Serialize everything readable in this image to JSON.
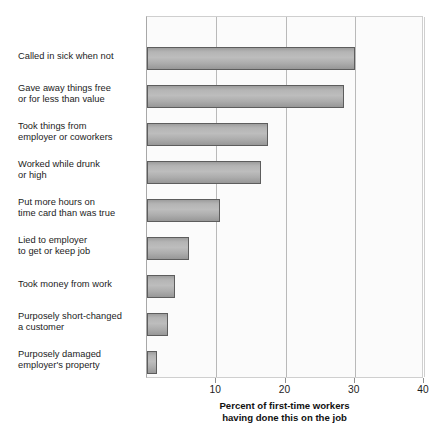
{
  "chart_data": {
    "type": "bar",
    "orientation": "horizontal",
    "title": "",
    "xlabel": "Percent of first-time workers having done this on the job",
    "xlabel_lines": [
      "Percent of first-time workers",
      "having done this on the job"
    ],
    "ylabel": "",
    "xlim": [
      0,
      40
    ],
    "xticks": [
      10,
      20,
      30,
      40
    ],
    "xtick_labels": [
      "10",
      "20",
      "30",
      "40"
    ],
    "grid": "vertical",
    "legend": "none",
    "categories": [
      "Called in sick when not",
      "Gave away things free\nor for less than value",
      "Took things from\nemployer or coworkers",
      "Worked while drunk\nor high",
      "Put more hours on\ntime card than was true",
      "Lied to employer\nto get or keep job",
      "Took money from work",
      "Purposely short-changed\na customer",
      "Purposely damaged\nemployer's property"
    ],
    "values": [
      30,
      28.5,
      17.5,
      16.5,
      10.5,
      6,
      4,
      3,
      1.5
    ],
    "bar_color": "#b4b4b4",
    "bar_edge_color": "#5d5d5d",
    "plot_background": "#fbfbfb",
    "gridline_color": "#b9b9b9",
    "axis_color": "#a8a8a8",
    "text_color": "#1c1c1c"
  }
}
